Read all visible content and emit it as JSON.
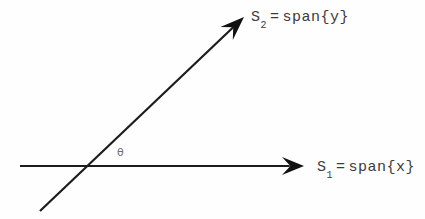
{
  "figure": {
    "background_color": "#fefefe",
    "stroke_color": "#1c1c1c",
    "text_color": "#3b3b3b",
    "angle_label": "θ",
    "angle_label_color": "#6e6e6e"
  },
  "axes": {
    "horizontal": {
      "name": "S1",
      "symbol": "S",
      "subscript": "1",
      "equals": "=",
      "expression": "span{x}",
      "full_label": "S1 = span{x}",
      "start_x": 20,
      "start_y": 166,
      "tip_x": 304,
      "tip_y": 166
    },
    "diagonal": {
      "name": "S2",
      "symbol": "S",
      "subscript": "2",
      "equals": "=",
      "expression": "span{y}",
      "full_label": "S2 = span{y}",
      "start_x": 40,
      "start_y": 211,
      "tip_x": 244,
      "tip_y": 17,
      "angle_degrees": 43
    },
    "intersection": {
      "x": 90,
      "y": 166
    }
  },
  "chart_data": {
    "type": "line",
    "title": "",
    "xlabel": "",
    "ylabel": "",
    "annotations": [
      {
        "text": "S2 = span{y}",
        "x": 251,
        "y": 22
      },
      {
        "text": "S1 = span{x}",
        "x": 317,
        "y": 172
      },
      {
        "text": "θ",
        "x": 121,
        "y": 154
      }
    ],
    "series": [
      {
        "name": "S1 = span{x}",
        "x": [
          20,
          304
        ],
        "y": [
          166,
          166
        ]
      },
      {
        "name": "S2 = span{y}",
        "x": [
          40,
          244
        ],
        "y": [
          211,
          17
        ]
      }
    ],
    "grid": false,
    "legend": "none"
  }
}
